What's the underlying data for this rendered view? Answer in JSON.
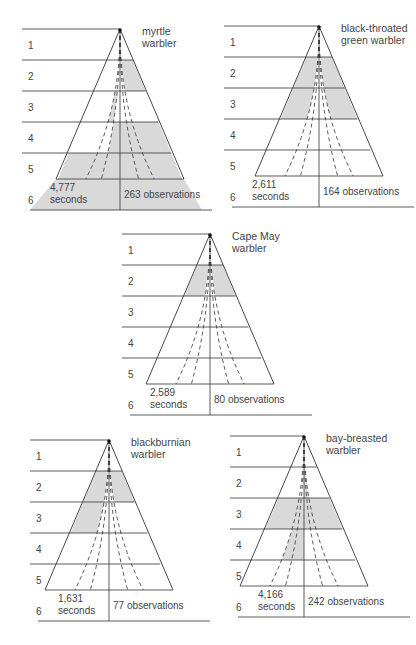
{
  "figure": {
    "row_labels": [
      "1",
      "2",
      "3",
      "4",
      "5",
      "6"
    ],
    "panels": [
      {
        "id": "myrtle",
        "title_line1": "myrtle",
        "title_line2": "warbler",
        "seconds_value": "4,777",
        "seconds_label": "seconds",
        "observations": "263 observations",
        "shaded": "zones 2-3 inner bands, zone 4 center, zones 5-6 full width"
      },
      {
        "id": "black-throated-green",
        "title_line1": "black-throated",
        "title_line2": "green warbler",
        "seconds_value": "2,611",
        "seconds_label": "seconds",
        "observations": "164 observations",
        "shaded": "zones 2-3 outer bands"
      },
      {
        "id": "cape-may",
        "title_line1": "Cape May",
        "title_line2": "warbler",
        "seconds_value": "2,589",
        "seconds_label": "seconds",
        "observations": "80 observations",
        "shaded": "zone 2 outer bands"
      },
      {
        "id": "blackburnian",
        "title_line1": "blackburnian",
        "title_line2": "warbler",
        "seconds_value": "1,631",
        "seconds_label": "seconds",
        "observations": "77 observations",
        "shaded": "zone 2 outer bands, zone 3 left outer band"
      },
      {
        "id": "bay-breasted",
        "title_line1": "bay-breasted",
        "title_line2": "warbler",
        "seconds_value": "4,166",
        "seconds_label": "seconds",
        "observations": "242 observations",
        "shaded": "zone 2 inner, zone 3 full, zone 4 left inner"
      }
    ],
    "colors": {
      "shade": "#d9d9d9",
      "line": "#333333"
    }
  }
}
